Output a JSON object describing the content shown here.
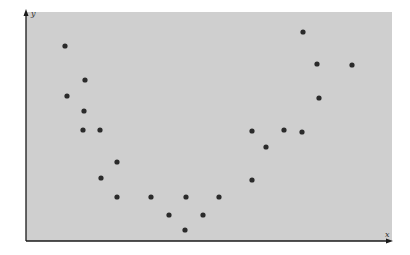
{
  "chart_data": {
    "type": "scatter",
    "title": "",
    "xlabel": "x",
    "ylabel": "y",
    "grid": false,
    "legend": null,
    "axis_ticks": "none",
    "xlim": [
      0,
      366
    ],
    "ylim": [
      0,
      229
    ],
    "series": [
      {
        "name": "points",
        "color": "#2b2b2b",
        "points": [
          {
            "x": 39,
            "y": 195
          },
          {
            "x": 59,
            "y": 161
          },
          {
            "x": 41,
            "y": 145
          },
          {
            "x": 58,
            "y": 130
          },
          {
            "x": 57,
            "y": 111
          },
          {
            "x": 74,
            "y": 111
          },
          {
            "x": 91,
            "y": 79
          },
          {
            "x": 75,
            "y": 63
          },
          {
            "x": 91,
            "y": 44
          },
          {
            "x": 125,
            "y": 44
          },
          {
            "x": 160,
            "y": 44
          },
          {
            "x": 193,
            "y": 44
          },
          {
            "x": 143,
            "y": 26
          },
          {
            "x": 177,
            "y": 26
          },
          {
            "x": 159,
            "y": 11
          },
          {
            "x": 226,
            "y": 110
          },
          {
            "x": 240,
            "y": 94
          },
          {
            "x": 226,
            "y": 61
          },
          {
            "x": 258,
            "y": 111
          },
          {
            "x": 276,
            "y": 109
          },
          {
            "x": 277,
            "y": 209
          },
          {
            "x": 291,
            "y": 177
          },
          {
            "x": 326,
            "y": 176
          },
          {
            "x": 293,
            "y": 143
          }
        ]
      }
    ]
  },
  "colors": {
    "plot_background": "#cfcfcf",
    "axis": "#1a1a1a",
    "point": "#2b2b2b"
  }
}
